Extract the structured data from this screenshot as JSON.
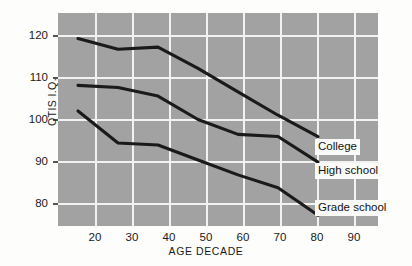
{
  "chart_data": {
    "type": "line",
    "title": "",
    "xlabel": "AGE DECADE",
    "ylabel": "OTIS I.Q.",
    "x": [
      20,
      30,
      40,
      50,
      60,
      70,
      80
    ],
    "xticks": [
      20,
      30,
      40,
      50,
      60,
      70,
      80,
      90
    ],
    "yticks": [
      80,
      90,
      100,
      110,
      120
    ],
    "xlim": [
      15,
      95
    ],
    "ylim": [
      74,
      124
    ],
    "grid": true,
    "legend_position": "right-inline-labels",
    "plot_background": "#a2a2a2",
    "gridline_color": "#f2f2f2",
    "line_color": "#1a1a1a",
    "series": [
      {
        "name": "College",
        "values": [
          118,
          115.5,
          116,
          111,
          105.5,
          100,
          95
        ]
      },
      {
        "name": "High school",
        "values": [
          107,
          106.5,
          104.5,
          99,
          95.5,
          95,
          89
        ]
      },
      {
        "name": "Grade school",
        "values": [
          101,
          93.5,
          93,
          89.5,
          86,
          83,
          76.5
        ]
      }
    ]
  },
  "axis": {
    "y_label": "OTIS I.Q.",
    "x_label": "AGE DECADE",
    "y_tick_labels": [
      "120",
      "110",
      "100",
      "90",
      "80"
    ],
    "x_tick_labels": [
      "20",
      "30",
      "40",
      "50",
      "60",
      "70",
      "80",
      "90"
    ]
  },
  "series_labels": [
    {
      "text": "College"
    },
    {
      "text": "High school"
    },
    {
      "text": "Grade school"
    }
  ]
}
